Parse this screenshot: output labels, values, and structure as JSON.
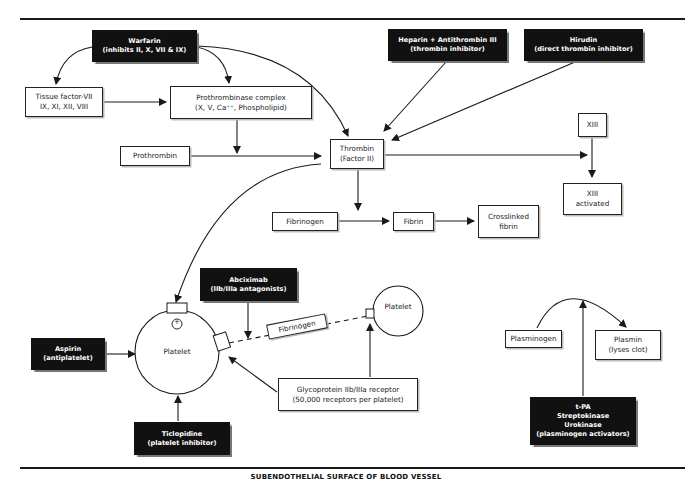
{
  "diagram": {
    "footer_label": "SUBENDOTHELIAL SURFACE OF BLOOD VESSEL",
    "colors": {
      "ink": "#1a1a1a",
      "drug_box_bg": "#111111",
      "drug_box_text": "#ffffff",
      "paper": "#ffffff"
    },
    "drugs": {
      "warfarin": {
        "line1": "Warfarin",
        "line2": "(inhibits II, X, VII & IX)"
      },
      "heparin": {
        "line1": "Heparin + Antithrombin III",
        "line2": "(thrombin inhibitor)"
      },
      "hirudin": {
        "line1": "Hirudin",
        "line2": "(direct thrombin inhibitor)"
      },
      "abciximab": {
        "line1": "Abciximab",
        "line2": "(IIb/IIIa antagonists)"
      },
      "aspirin": {
        "line1": "Aspirin",
        "line2": "(antiplatelet)"
      },
      "ticlopidine": {
        "line1": "Ticlopidine",
        "line2": "(platelet inhibitor)"
      },
      "thrombolytics": {
        "line1": "t-PA",
        "line2": "Streptokinase",
        "line3": "Urokinase",
        "line4": "(plasminogen activators)"
      }
    },
    "factors": {
      "tissue_factor": {
        "line1": "Tissue factor-VII",
        "line2": "IX, XI, XII, VIII"
      },
      "prothrombinase": {
        "line1": "Prothrombinase complex",
        "line2": "(X, V, Ca⁺⁺, Phospholipid)"
      },
      "prothrombin": {
        "line1": "Prothrombin"
      },
      "thrombin": {
        "line1": "Thrombin",
        "line2": "(Factor II)"
      },
      "xiii": {
        "line1": "XIII"
      },
      "xiii_activated": {
        "line1": "XIII",
        "line2": "activated"
      },
      "fibrinogen": {
        "line1": "Fibrinogen"
      },
      "fibrin": {
        "line1": "Fibrin"
      },
      "crosslinked_fibrin": {
        "line1": "Crosslinked",
        "line2": "fibrin"
      },
      "glycoprotein_receptor": {
        "line1": "Glycoprotein IIb/IIIa receptor",
        "line2": "(50,000 receptors per platelet)"
      },
      "bridge_fibrinogen": {
        "line1": "Fibrinogen"
      },
      "plasminogen": {
        "line1": "Plasminogen"
      },
      "plasmin": {
        "line1": "Plasmin",
        "line2": "(lyses clot)"
      }
    },
    "platelets": {
      "main": {
        "label": "Platelet",
        "activation_sign": "+"
      },
      "secondary": {
        "label": "Platelet"
      }
    }
  }
}
